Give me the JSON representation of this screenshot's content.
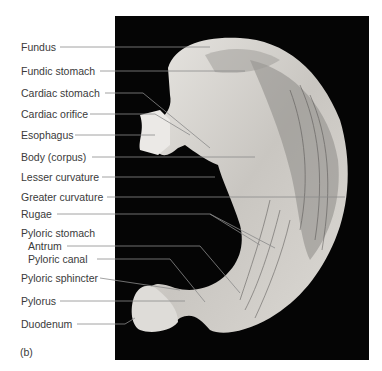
{
  "figure": {
    "panel_label": "(b)",
    "background_color": "#050505",
    "label_color": "#3a3a3a",
    "leader_color": "#8a8a8a"
  },
  "labels": [
    {
      "id": "fundus",
      "text": "Fundus"
    },
    {
      "id": "fundic-stomach",
      "text": "Fundic stomach"
    },
    {
      "id": "cardiac-stomach",
      "text": "Cardiac stomach"
    },
    {
      "id": "cardiac-orifice",
      "text": "Cardiac orifice"
    },
    {
      "id": "esophagus",
      "text": "Esophagus"
    },
    {
      "id": "body",
      "text": "Body (corpus)"
    },
    {
      "id": "lesser-curvature",
      "text": "Lesser curvature"
    },
    {
      "id": "greater-curvature",
      "text": "Greater curvature"
    },
    {
      "id": "rugae",
      "text": "Rugae"
    },
    {
      "id": "pyloric-stomach",
      "text": "Pyloric stomach"
    },
    {
      "id": "antrum",
      "text": "Antrum"
    },
    {
      "id": "pyloric-canal",
      "text": "Pyloric canal"
    },
    {
      "id": "pyloric-sphincter",
      "text": "Pyloric sphincter"
    },
    {
      "id": "pylorus",
      "text": "Pylorus"
    },
    {
      "id": "duodenum",
      "text": "Duodenum"
    }
  ]
}
